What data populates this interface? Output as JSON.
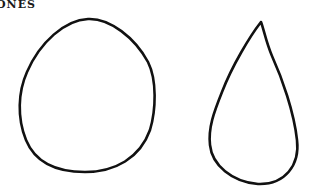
{
  "heading": {
    "text": "ONES"
  },
  "shapes": [
    {
      "name": "egg-shape",
      "label": "rounded egg outline"
    },
    {
      "name": "teardrop-shape",
      "label": "teardrop outline"
    }
  ],
  "style": {
    "stroke_color": "#111111",
    "background_color": "#ffffff"
  }
}
